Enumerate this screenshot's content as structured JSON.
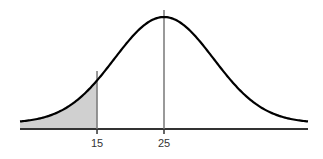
{
  "chart_data": {
    "type": "area",
    "title": "",
    "xlabel": "",
    "ylabel": "",
    "distribution": {
      "kind": "normal",
      "mean": 25,
      "sd": 7.4
    },
    "x_range": [
      3.5,
      46.5
    ],
    "tick_labels": [
      "15",
      "25"
    ],
    "ticks": [
      15,
      25
    ],
    "reference_lines": [
      {
        "x": 15,
        "label": "15"
      },
      {
        "x": 25,
        "label": "25"
      }
    ],
    "shaded_region": {
      "from": 3.5,
      "to": 15,
      "color": "#d0d0d0"
    },
    "grid": false,
    "legend": null,
    "colors": {
      "curve": "#000000",
      "axis": "#333333",
      "ref_line": "#777777",
      "shade": "#d0d0d0"
    }
  }
}
